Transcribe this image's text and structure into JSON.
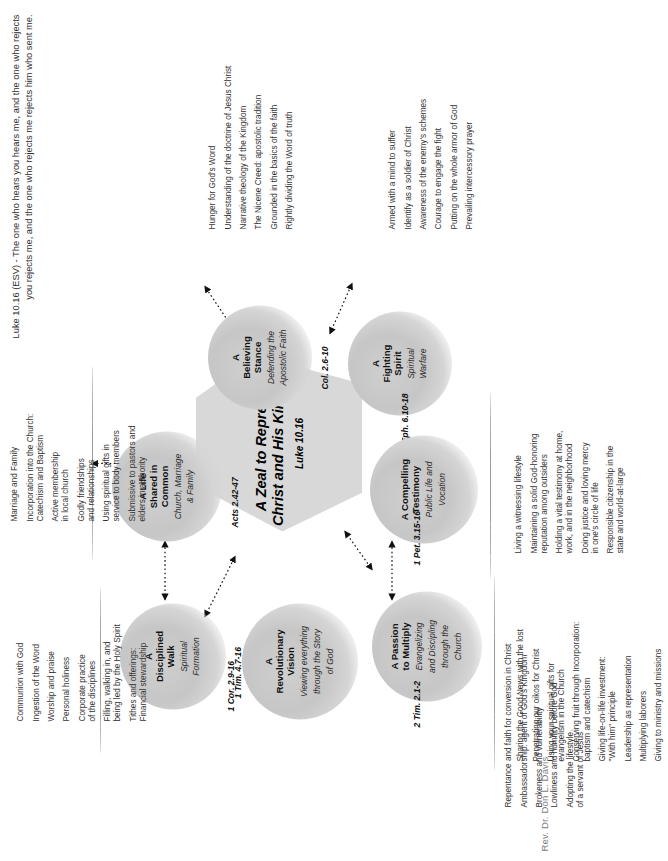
{
  "header": {
    "verse": "Luke 10.16 (ESV) - The one who hears you hears me, and the one who rejects you rejects me, and the one who rejects me rejects him who sent me."
  },
  "credit": "Rev. Dr. Don L. Davis",
  "center": {
    "title": "A Zeal to Represent Christ and His Kingdom",
    "reference": "Luke 10.16"
  },
  "nodes": [
    {
      "id": "disciplined-walk",
      "title": "A\nDisciplined\nWalk",
      "title_line1": "A",
      "title_line2": "Disciplined",
      "title_line3": "Walk",
      "subtitle": "Spiritual\nFormation",
      "subtitle_line1": "Spiritual",
      "subtitle_line2": "Formation",
      "reference": "1 Tim. 4.7-16",
      "items": [
        "Communion with God",
        "Ingestion of the Word",
        "Worship and praise",
        "Personal holiness",
        "Corporate practice\nof the disciplines",
        "Filling, walking in, and\nbeing led by the Holy Spirit",
        "Tithes and offerings:\nFinancial stewardship"
      ]
    },
    {
      "id": "life-shared-in-common",
      "title_line1": "A Life",
      "title_line2": "Shared in",
      "title_line3": "Common",
      "subtitle_line1": "Church, Marriage",
      "subtitle_line2": "& Family",
      "reference": "Acts 2.42-47",
      "items": [
        "Marriage and Family",
        "Incorporation into the Church:\nCatechism and Baptism",
        "Active membership\nin local church",
        "Godly friendships\nand relationships",
        "Using spiritual gifts in\nservice to body members",
        "Submissive to pastors and\nelders in authority"
      ]
    },
    {
      "id": "believing-stance",
      "title_line1": "A",
      "title_line2": "Believing",
      "title_line3": "Stance",
      "subtitle_line1": "Defending the",
      "subtitle_line2": "Apostolic Faith",
      "reference": "Col. 2.6-10",
      "items": [
        "Hunger for God's Word",
        "Understanding of the doctrine of Jesus Christ",
        "Narrative theology of the Kingdom",
        "The Nicene Creed: apostolic tradition",
        "Grounded in the basics of the faith",
        "Rightly dividing the Word of truth"
      ]
    },
    {
      "id": "fighting-spirit",
      "title_line1": "A",
      "title_line2": "Fighting",
      "title_line3": "Spirit",
      "subtitle_line1": "Spiritual",
      "subtitle_line2": "Warfare",
      "reference": "Eph. 6.10-18",
      "items": [
        "Armed with a mind to suffer",
        "Identify as a soldier of Christ",
        "Awareness of the enemy's schemes",
        "Courage to engage the fight",
        "Putting on the whole armor of God",
        "Prevailing intercessory prayer"
      ]
    },
    {
      "id": "compelling-testimony",
      "title_line1": "A Compelling",
      "title_line2": "Testimony",
      "title_line3": "",
      "subtitle_line1": "Public Life and",
      "subtitle_line2": "Vocation",
      "reference": "1 Pet. 3.15-16",
      "items": [
        "Living a witnessing lifestyle",
        "Maintaining a solid God-honoring\nreputation among outsiders",
        "Holding a vital testimony at home,\nwork, and in the neighborhood",
        "Doing justice and loving mercy\nin one's circle of life",
        "Responsible citizenship in the\nstate and world-at-large"
      ]
    },
    {
      "id": "passion-to-multiply",
      "title_line1": "A Passion",
      "title_line2": "to Multiply",
      "title_line3": "",
      "subtitle_line1": "Evangelizing",
      "subtitle_line2": "and Discipling",
      "subtitle_line3": "through the",
      "subtitle_line4": "Church",
      "reference": "2 Tim. 2.1-2",
      "items": [
        "Sharing the Good News with the lost",
        "Penetrating our oikos for Christ",
        "Using your spiritual gifts for\nevangelism in the Church",
        "Conserving fruit through Incorporation:\nbaptism and catechism",
        "Giving life-on-life investment:\n\"With him\" principle",
        "Leadership as representation",
        "Multiplying laborers",
        "Giving to ministry and missions"
      ]
    },
    {
      "id": "revolutionary-vision",
      "title_line1": "A",
      "title_line2": "Revolutionary",
      "title_line3": "Vision",
      "subtitle_line1": "Viewing everything",
      "subtitle_line2": "through the Story",
      "subtitle_line3": "of God",
      "reference": "1 Cor. 2.9-16",
      "items": [
        "Repentance and faith for conversion in Christ",
        "Ambassadorship: agent of God's Kingdom",
        "Brokeness and vulnerability",
        "Lowliness and humility before God",
        "Adopting the lifestyle\nof a servant of Jesus"
      ]
    }
  ]
}
